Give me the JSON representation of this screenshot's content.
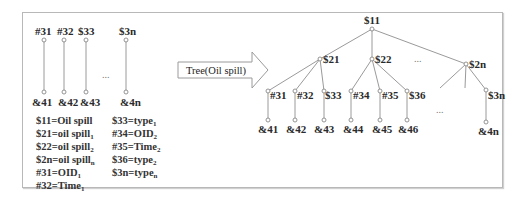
{
  "left_panel": {
    "top_labels": [
      "#31",
      "#32",
      "$33",
      "$3n"
    ],
    "bottom_labels": [
      "&41",
      "&42",
      "&43",
      "&4n"
    ],
    "ellipsis": "...",
    "legend_col1": [
      {
        "text": "$11=Oil spill",
        "sub": ""
      },
      {
        "text": "$21=oil spill",
        "sub": "1"
      },
      {
        "text": "$22=oil spill",
        "sub": "2"
      },
      {
        "text": "$2n=oil spill",
        "sub": "n"
      },
      {
        "text": "#31=OID",
        "sub": "1"
      },
      {
        "text": "#32=Time",
        "sub": "1"
      }
    ],
    "legend_col2": [
      {
        "text": "$33=type",
        "sub": "1"
      },
      {
        "text": "#34=OID",
        "sub": "2"
      },
      {
        "text": "#35=Time",
        "sub": "2"
      },
      {
        "text": "$36=type",
        "sub": "2"
      },
      {
        "text": "$3n=type",
        "sub": "n"
      }
    ]
  },
  "arrow": {
    "label": "Tree(Oil spill)"
  },
  "tree": {
    "root": "$11",
    "level2": [
      "$21",
      "$22",
      "$2n"
    ],
    "level2_ellipsis": "...",
    "level3": [
      "#31",
      "#32",
      "$33",
      "#34",
      "#35",
      "$36",
      "$3n"
    ],
    "level3_ellipsis": "...",
    "level4": [
      "&41",
      "&42",
      "&43",
      "&44",
      "&45",
      "&46",
      "&4n"
    ]
  },
  "colors": {
    "edge": "#9a9a9a",
    "border": "#b8b8b8",
    "text": "#2a2a2a"
  }
}
